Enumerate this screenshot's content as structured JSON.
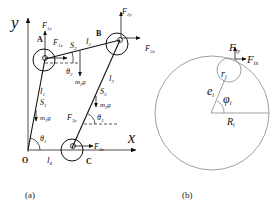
{
  "figure": {
    "panel_a": {
      "caption": "(a)",
      "axes": {
        "y_label": "y",
        "x_label": "x",
        "origin_label": "O"
      },
      "points": {
        "A": "A",
        "B": "B",
        "C": "C"
      },
      "links": {
        "l1": "l",
        "l1_sub": "1",
        "l2": "l",
        "l2_sub": "2",
        "l3": "l",
        "l3_sub": "3",
        "l4": "l",
        "l4_sub": "4"
      },
      "centers_of_mass": {
        "S1": "S",
        "S1_sub": "1",
        "S2": "S",
        "S2_sub": "2",
        "S3": "S",
        "S3_sub": "3"
      },
      "weights": {
        "m1g_m": "m",
        "m1g_sub": "1",
        "m1g_g": "g",
        "m2g_m": "m",
        "m2g_sub": "2",
        "m2g_g": "g",
        "m3g_m": "m",
        "m3g_sub": "3",
        "m3g_g": "g"
      },
      "angles": {
        "theta1": "θ",
        "theta1_sub": "1",
        "theta2": "θ",
        "theta2_sub": "2",
        "theta3": "θ",
        "theta3_sub": "3"
      },
      "forces": {
        "F1y": "F",
        "F1y_sub": "1y",
        "F1x": "F",
        "F1x_sub": "1x",
        "F2y": "F",
        "F2y_sub": "2y",
        "F2x": "F",
        "F2x_sub": "2x",
        "F3y": "F",
        "F3y_sub": "3y",
        "F3x": "F",
        "F3x_sub": "3x"
      }
    },
    "panel_b": {
      "caption": "(b)",
      "labels": {
        "Fiy": "F",
        "Fiy_sub": "iy",
        "Fix": "F",
        "Fix_sub": "ix",
        "ri": "r",
        "ri_sub": "i",
        "ei": "e",
        "ei_sub": "i",
        "phii": "φ",
        "phii_sub": "i",
        "Ri": "R",
        "Ri_sub": "i"
      }
    },
    "colors": {
      "ink": "#111111",
      "light_ink": "#555555",
      "background": "#ffffff"
    }
  }
}
